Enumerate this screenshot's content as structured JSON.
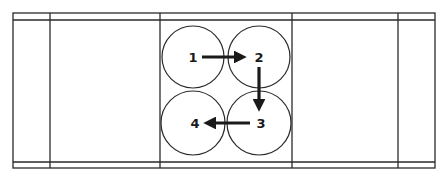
{
  "diagram": {
    "title": "",
    "colors": {
      "line": "#2a2a2a",
      "fill": "#ffffff",
      "arrow": "#1a1a1a"
    },
    "frame": {
      "outer": {
        "left": 13,
        "right": 435,
        "top": 13,
        "bottom": 168
      },
      "inner_top_line_y": 20,
      "inner_bottom_line_y": 162,
      "vertical_dividers_x": [
        50,
        160,
        292,
        398
      ]
    },
    "nodes": [
      {
        "id": "1",
        "label": "1",
        "cx": 193,
        "cy": 57,
        "r": 31
      },
      {
        "id": "2",
        "label": "2",
        "cx": 259,
        "cy": 57,
        "r": 31
      },
      {
        "id": "3",
        "label": "3",
        "cx": 259,
        "cy": 123,
        "r": 32
      },
      {
        "id": "4",
        "label": "4",
        "cx": 193,
        "cy": 123,
        "r": 32
      }
    ],
    "edges": [
      {
        "from": "1",
        "to": "2",
        "direction": "right"
      },
      {
        "from": "2",
        "to": "3",
        "direction": "down"
      },
      {
        "from": "3",
        "to": "4",
        "direction": "left"
      }
    ]
  }
}
